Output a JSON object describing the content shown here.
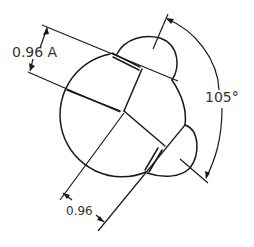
{
  "diagram": {
    "type": "technical-drawing",
    "dimensions": {
      "top_left": "0.96 A",
      "bottom": "0.96",
      "angle": "105°"
    },
    "colors": {
      "line": "#1a1a1a",
      "text": "#333333",
      "background": "#ffffff"
    }
  }
}
